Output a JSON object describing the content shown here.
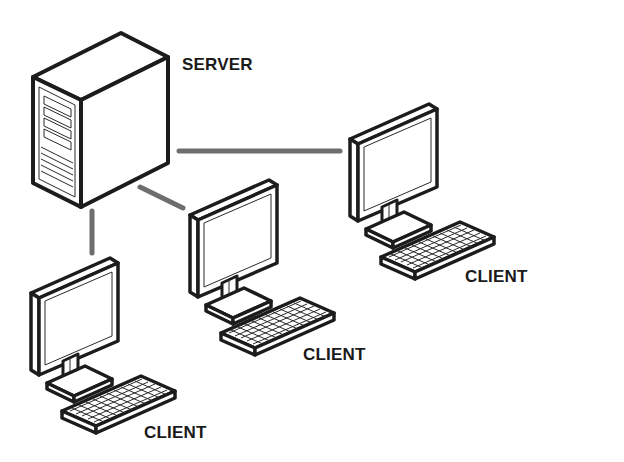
{
  "diagram": {
    "type": "client-server network",
    "colors": {
      "ink": "#1c1c1c",
      "connector": "#6e6e6e",
      "background": "#ffffff"
    },
    "nodes": [
      {
        "id": "server",
        "kind": "server-tower-icon",
        "label": "SERVER"
      },
      {
        "id": "client-right",
        "kind": "desktop-computer-icon",
        "label": "CLIENT"
      },
      {
        "id": "client-middle",
        "kind": "desktop-computer-icon",
        "label": "CLIENT"
      },
      {
        "id": "client-left",
        "kind": "desktop-computer-icon",
        "label": "CLIENT"
      }
    ],
    "edges": [
      {
        "from": "server",
        "to": "client-right"
      },
      {
        "from": "server",
        "to": "client-middle"
      },
      {
        "from": "server",
        "to": "client-left"
      }
    ]
  }
}
